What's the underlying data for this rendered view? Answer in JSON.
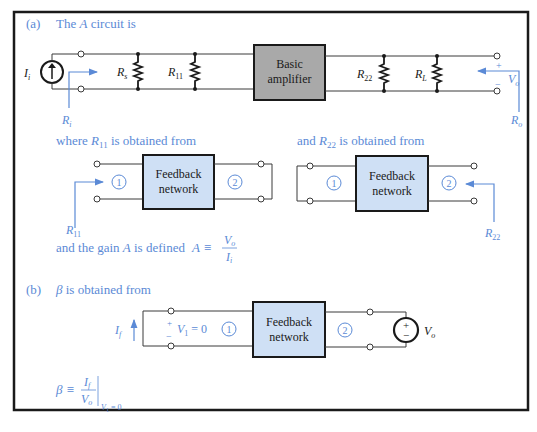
{
  "part_a": {
    "label": "(a)",
    "heading_pre": "The ",
    "heading_var": "A",
    "heading_post": " circuit is",
    "source_label": "I",
    "source_sub": "i",
    "ri_label": "R",
    "ri_sub": "i",
    "rs_label": "R",
    "rs_sub": "s",
    "r11_label": "R",
    "r11_sub": "11",
    "amp_line1": "Basic",
    "amp_line2": "amplifier",
    "r22_label": "R",
    "r22_sub": "22",
    "rl_label": "R",
    "rl_sub": "L",
    "vo_label": "V",
    "vo_sub": "o",
    "vo_plus": "+",
    "vo_minus": "−",
    "ro_label": "R",
    "ro_sub": "o",
    "r11_text_pre": "where ",
    "r11_text_var": "R",
    "r11_text_sub": "11",
    "r11_text_post": " is obtained from",
    "r22_text_pre": "and ",
    "r22_text_var": "R",
    "r22_text_sub": "22",
    "r22_text_post": " is obtained from",
    "fb_line1": "Feedback",
    "fb_line2": "network",
    "port1": "1",
    "port2": "2",
    "gain_text_pre": "and the gain ",
    "gain_text_var": "A",
    "gain_text_post": " is defined",
    "gain_eq_lhs": "A ≡",
    "gain_num": "V",
    "gain_num_sub": "o",
    "gain_den": "I",
    "gain_den_sub": "i"
  },
  "part_b": {
    "label": "(b)",
    "heading_var": "β",
    "heading_post": " is obtained from",
    "if_label": "I",
    "if_sub": "f",
    "v1_plus": "+",
    "v1_minus": "−",
    "v1_eq": "V",
    "v1_sub": "1",
    "v1_val": " = 0",
    "fb_line1": "Feedback",
    "fb_line2": "network",
    "port1": "1",
    "port2": "2",
    "vs_label": "V",
    "vs_sub": "o",
    "vs_plus": "+",
    "vs_minus": "−",
    "beta_lhs": "β ≡",
    "beta_num": "I",
    "beta_num_sub": "f",
    "beta_den": "V",
    "beta_den_sub": "o",
    "beta_cond": "V",
    "beta_cond_sub": "1",
    "beta_cond_val": " = 0"
  },
  "colors": {
    "annotation_blue": "#5b8ad6",
    "amplifier_fill": "#a9a9a9",
    "feedback_fill": "#cfe0f5",
    "wire": "#3a3a3a",
    "frame": "#1a1a1a"
  }
}
